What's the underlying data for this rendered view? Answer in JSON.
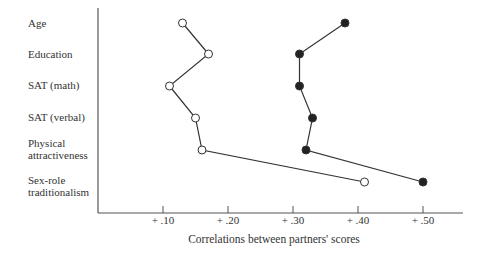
{
  "chart_data": {
    "type": "line",
    "orientation": "horizontal-dot-profile",
    "title": "",
    "xlabel": "Correlations between partners' scores",
    "ylabel": "",
    "xlim": [
      0,
      0.56
    ],
    "x_ticks": [
      "+.10",
      "+.20",
      "+.30",
      "+.40",
      "+.50"
    ],
    "x_tick_values": [
      0.1,
      0.2,
      0.3,
      0.4,
      0.5
    ],
    "grid": false,
    "legend": null,
    "categories": [
      "Age",
      "Education",
      "SAT (math)",
      "SAT (verbal)",
      "Physical\nattractiveness",
      "Sex-role\ntraditionalism"
    ],
    "series": [
      {
        "name": "open circles",
        "marker": "open-circle",
        "values": [
          0.13,
          0.17,
          0.11,
          0.15,
          0.16,
          0.41
        ]
      },
      {
        "name": "filled circles",
        "marker": "filled-circle",
        "values": [
          0.38,
          0.31,
          0.31,
          0.33,
          0.32,
          0.5
        ]
      }
    ]
  },
  "labels": {
    "rows": [
      "Age",
      "Education",
      "SAT (math)",
      "SAT (verbal)",
      "Physical\nattractiveness",
      "Sex-role\ntraditionalism"
    ],
    "ticks": [
      "+ .10",
      "+ .20",
      "+ .30",
      "+ .40",
      "+ .50"
    ],
    "xlabel": "Correlations between partners' scores"
  }
}
